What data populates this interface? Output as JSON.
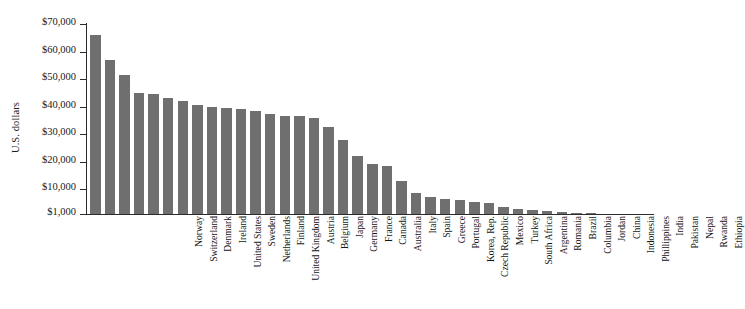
{
  "chart_data": {
    "type": "bar",
    "title": "",
    "subtitle": "",
    "xlabel": "",
    "ylabel": "U.S. dollars",
    "ylim": [
      1000,
      70000
    ],
    "grid": false,
    "legend": null,
    "bar_color": "#6f6f6f",
    "y_ticks": [
      {
        "value": 70000,
        "label": "$70,000"
      },
      {
        "value": 60000,
        "label": "$60,000"
      },
      {
        "value": 50000,
        "label": "$50,000"
      },
      {
        "value": 40000,
        "label": "$40,000"
      },
      {
        "value": 30000,
        "label": "$30,000"
      },
      {
        "value": 20000,
        "label": "$20,000"
      },
      {
        "value": 10000,
        "label": "$10,000"
      },
      {
        "value": 1000,
        "label": "$1,000"
      }
    ],
    "categories": [
      "Norway",
      "Switzerland",
      "Denmark",
      "Ireland",
      "United States",
      "Sweden",
      "Netherlands",
      "Finland",
      "United Kingdom",
      "Austria",
      "Belgium",
      "Japan",
      "Germany",
      "France",
      "Canada",
      "Australia",
      "Italy",
      "Spain",
      "Greece",
      "Portugal",
      "Korea, Rep.",
      "Czech Republic",
      "Mexico",
      "Turkey",
      "South Africa",
      "Argentina",
      "Romania",
      "Brazil",
      "Columbia",
      "Jordan",
      "China",
      "Indonesia",
      "Phillippines",
      "India",
      "Pakistan",
      "Nepal",
      "Rwanda",
      "Ethiopia"
    ],
    "values": [
      66000,
      57000,
      51500,
      45000,
      44500,
      43000,
      42000,
      40500,
      40000,
      39500,
      39000,
      38500,
      37500,
      36500,
      36500,
      36000,
      32500,
      28000,
      22000,
      19000,
      18500,
      13000,
      8500,
      7000,
      6500,
      6000,
      5500,
      5000,
      3500,
      3000,
      2500,
      2000,
      1800,
      1400,
      1200,
      900,
      700,
      500
    ]
  }
}
